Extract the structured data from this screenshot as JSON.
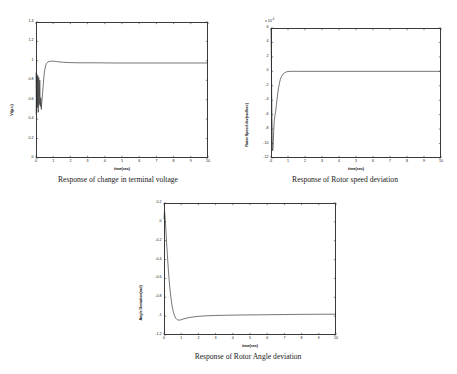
{
  "page": {
    "title": "Simulation response plots"
  },
  "figures": [
    {
      "id": "terminal-voltage",
      "caption": "Response of change in terminal voltage",
      "xlabel": "time(sec)",
      "ylabel": "Vt(p.u)",
      "exponent": "",
      "yticks": [
        "0",
        "0.2",
        "0.4",
        "0.6",
        "0.8",
        "1",
        "1.2",
        "1.4"
      ],
      "xticks": [
        "0",
        "1",
        "2",
        "3",
        "4",
        "5",
        "6",
        "7",
        "8",
        "9",
        "10"
      ]
    },
    {
      "id": "rotor-speed-deviation",
      "caption": "Response of Rotor speed deviation",
      "xlabel": "time(sec)",
      "ylabel": "Rotor Speed dev(rad/sec)",
      "exponent": "x 10",
      "exponent_sup": "-4",
      "yticks": [
        "-12",
        "-10",
        "-8",
        "-6",
        "-4",
        "-2",
        "0",
        "2",
        "4",
        "6"
      ],
      "xticks": [
        "0",
        "1",
        "2",
        "3",
        "4",
        "5",
        "6",
        "7",
        "8",
        "9",
        "10"
      ]
    },
    {
      "id": "rotor-angle-deviation",
      "caption": "Response of Rotor Angle deviation",
      "xlabel": "time(sec)",
      "ylabel": "Angle Deviation(rad)",
      "exponent": "",
      "yticks": [
        "-1.2",
        "-1",
        "-0.8",
        "-0.6",
        "-0.4",
        "-0.2",
        "0",
        "0.2"
      ],
      "xticks": [
        "0",
        "1",
        "2",
        "3",
        "4",
        "5",
        "6",
        "7",
        "8",
        "9",
        "10"
      ]
    }
  ],
  "chart_data": [
    {
      "type": "line",
      "id": "terminal-voltage",
      "title": "Response of change in terminal voltage",
      "xlabel": "time(sec)",
      "ylabel": "Vt(p.u)",
      "xlim": [
        0,
        10
      ],
      "ylim": [
        0,
        1.4
      ],
      "grid": false,
      "legend": null,
      "series": [
        {
          "name": "Vt",
          "x": [
            0,
            0.02,
            0.05,
            0.08,
            0.1,
            0.13,
            0.16,
            0.19,
            0.22,
            0.25,
            0.28,
            0.31,
            0.34,
            0.38,
            0.42,
            0.46,
            0.5,
            0.56,
            0.62,
            0.7,
            0.8,
            0.9,
            1.0,
            1.2,
            1.4,
            1.6,
            1.8,
            2.0,
            2.5,
            3.0,
            3.5,
            4.0,
            4.5,
            5.0,
            6.0,
            7.0,
            8.0,
            9.0,
            10.0
          ],
          "y": [
            0.88,
            0.45,
            0.86,
            0.52,
            0.85,
            0.47,
            0.83,
            0.55,
            0.8,
            0.53,
            0.62,
            0.5,
            0.58,
            0.66,
            0.75,
            0.84,
            0.9,
            0.95,
            0.975,
            0.99,
            0.995,
            0.997,
            0.997,
            0.993,
            0.988,
            0.985,
            0.983,
            0.982,
            0.98,
            0.98,
            0.98,
            0.979,
            0.978,
            0.978,
            0.978,
            0.978,
            0.978,
            0.978,
            0.978
          ]
        }
      ]
    },
    {
      "type": "line",
      "id": "rotor-speed-deviation",
      "title": "Response of Rotor speed deviation",
      "xlabel": "time(sec)",
      "ylabel": "Rotor Speed dev(rad/sec)",
      "y_multiplier": "x 10^-4",
      "xlim": [
        0,
        10
      ],
      "ylim": [
        -12,
        6
      ],
      "grid": false,
      "legend": null,
      "series": [
        {
          "name": "Rotor speed deviation",
          "x": [
            0,
            0.02,
            0.04,
            0.06,
            0.08,
            0.1,
            0.12,
            0.14,
            0.16,
            0.18,
            0.2,
            0.24,
            0.28,
            0.32,
            0.36,
            0.4,
            0.45,
            0.5,
            0.55,
            0.6,
            0.7,
            0.8,
            0.9,
            1.0,
            1.1,
            1.2,
            1.5,
            2.0,
            3.0,
            4.0,
            5.0,
            6.0,
            7.0,
            8.0,
            9.0,
            10.0
          ],
          "y": [
            6.0,
            2.0,
            -3.0,
            -7.0,
            -10.5,
            -11.0,
            -10.6,
            -9.5,
            -8.2,
            -7.2,
            -6.6,
            -6.0,
            -5.4,
            -4.6,
            -3.8,
            -3.0,
            -2.2,
            -1.6,
            -1.1,
            -0.8,
            -0.4,
            -0.2,
            -0.08,
            -0.03,
            -0.01,
            0.0,
            0.0,
            0.0,
            0.0,
            0.0,
            0.0,
            0.0,
            0.0,
            0.0,
            0.0,
            0.0
          ]
        }
      ]
    },
    {
      "type": "line",
      "id": "rotor-angle-deviation",
      "title": "Response of Rotor Angle deviation",
      "xlabel": "time(sec)",
      "ylabel": "Angle Deviation(rad)",
      "xlim": [
        0,
        10
      ],
      "ylim": [
        -1.2,
        0.2
      ],
      "grid": false,
      "legend": null,
      "series": [
        {
          "name": "Rotor angle deviation",
          "x": [
            0,
            0.03,
            0.06,
            0.09,
            0.12,
            0.15,
            0.2,
            0.25,
            0.3,
            0.35,
            0.4,
            0.45,
            0.5,
            0.55,
            0.6,
            0.65,
            0.7,
            0.75,
            0.8,
            0.85,
            0.9,
            1.0,
            1.1,
            1.3,
            1.5,
            1.8,
            2.0,
            2.5,
            3.0,
            3.5,
            4.0,
            4.5,
            5.0,
            5.5,
            6.0,
            7.0,
            8.0,
            9.0,
            10.0
          ],
          "y": [
            0.03,
            0.12,
            0.06,
            -0.02,
            -0.12,
            -0.22,
            -0.36,
            -0.5,
            -0.62,
            -0.72,
            -0.8,
            -0.87,
            -0.92,
            -0.96,
            -0.99,
            -1.01,
            -1.025,
            -1.035,
            -1.04,
            -1.042,
            -1.042,
            -1.038,
            -1.032,
            -1.022,
            -1.014,
            -1.006,
            -1.002,
            -0.996,
            -0.993,
            -0.991,
            -0.989,
            -0.988,
            -0.987,
            -0.986,
            -0.985,
            -0.983,
            -0.981,
            -0.98,
            -0.979
          ]
        }
      ]
    }
  ]
}
